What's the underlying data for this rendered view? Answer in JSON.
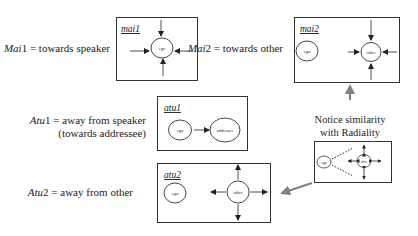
{
  "colors": {
    "ink": "#222222",
    "gray_arrow": "#808080",
    "background": "#ffffff"
  },
  "labels": {
    "mai1": {
      "prefix": "Mai",
      "num": "1",
      "desc": " = towards speaker"
    },
    "mai2": {
      "prefix": "Mai",
      "num": "2",
      "desc": " = towards other"
    },
    "atu1": {
      "prefix": "Atu",
      "num": "1",
      "desc": " = away from speaker",
      "line2": "(towards addressee)"
    },
    "atu2": {
      "prefix": "Atu",
      "num": "2",
      "desc": " = away from other"
    }
  },
  "boxes": {
    "mai1": {
      "title": "mai1",
      "nodes": [
        "ego"
      ]
    },
    "mai2": {
      "title": "mai2",
      "nodes": [
        "ego",
        "other"
      ]
    },
    "atu1": {
      "title": "atu1",
      "nodes": [
        "ego",
        "addressee"
      ]
    },
    "atu2": {
      "title": "atu2",
      "nodes": [
        "ego",
        "other"
      ]
    },
    "radiality": {
      "nodes": [
        "ego",
        "other"
      ]
    }
  },
  "note": {
    "line1": "Notice similarity",
    "line2": "with Radiality"
  }
}
